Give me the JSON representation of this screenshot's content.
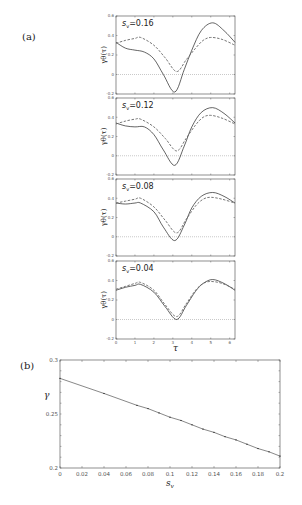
{
  "labels": {
    "a": "(a)",
    "b": "(b)"
  },
  "chart_data": [
    {
      "type": "line",
      "title": "(a)",
      "xlabel": "τ",
      "ylabel": "γθ(τ)",
      "xlim": [
        0,
        6.28
      ],
      "ylim": [
        -0.2,
        0.6
      ],
      "xticks": [
        0,
        1,
        2,
        3,
        4,
        5,
        6
      ],
      "yticks": [
        -0.2,
        0,
        0.2,
        0.4,
        0.6
      ],
      "reference_line": {
        "y": 0,
        "style": "dotted"
      },
      "panels": [
        {
          "annotation": "sv=0.16",
          "series": [
            {
              "name": "solid",
              "style": "solid",
              "x": [
                0,
                0.5,
                1.0,
                1.5,
                2.0,
                2.5,
                3.1,
                3.6,
                4.0,
                4.5,
                5.1,
                5.7,
                6.28
              ],
              "y": [
                0.33,
                0.27,
                0.25,
                0.23,
                0.16,
                0.0,
                -0.18,
                0.05,
                0.25,
                0.45,
                0.53,
                0.45,
                0.33
              ]
            },
            {
              "name": "dashed",
              "style": "dashed",
              "x": [
                0,
                0.5,
                1.0,
                1.3,
                2.0,
                2.6,
                3.2,
                3.7,
                4.2,
                4.6,
                5.0,
                5.6,
                6.28
              ],
              "y": [
                0.32,
                0.35,
                0.37,
                0.38,
                0.3,
                0.17,
                0.03,
                0.15,
                0.27,
                0.35,
                0.38,
                0.36,
                0.3
              ]
            }
          ]
        },
        {
          "annotation": "sv=0.12",
          "series": [
            {
              "name": "solid",
              "style": "solid",
              "x": [
                0,
                0.5,
                1.0,
                1.5,
                2.0,
                2.5,
                3.1,
                3.6,
                4.0,
                4.5,
                5.1,
                5.7,
                6.28
              ],
              "y": [
                0.34,
                0.31,
                0.3,
                0.3,
                0.22,
                0.06,
                -0.1,
                0.1,
                0.3,
                0.45,
                0.5,
                0.44,
                0.34
              ]
            },
            {
              "name": "dashed",
              "style": "dashed",
              "x": [
                0,
                0.5,
                1.0,
                1.3,
                2.0,
                2.6,
                3.2,
                3.7,
                4.2,
                4.6,
                5.0,
                5.6,
                6.28
              ],
              "y": [
                0.33,
                0.36,
                0.38,
                0.38,
                0.3,
                0.18,
                0.05,
                0.18,
                0.32,
                0.4,
                0.42,
                0.39,
                0.33
              ]
            }
          ]
        },
        {
          "annotation": "sv=0.08",
          "series": [
            {
              "name": "solid",
              "style": "solid",
              "x": [
                0,
                0.5,
                1.0,
                1.3,
                2.0,
                2.5,
                3.1,
                3.6,
                4.0,
                4.5,
                5.1,
                5.7,
                6.28
              ],
              "y": [
                0.35,
                0.34,
                0.35,
                0.35,
                0.26,
                0.1,
                -0.04,
                0.12,
                0.3,
                0.42,
                0.46,
                0.42,
                0.35
              ]
            },
            {
              "name": "dashed",
              "style": "dashed",
              "x": [
                0,
                0.5,
                1.0,
                1.3,
                2.0,
                2.6,
                3.2,
                3.7,
                4.2,
                4.6,
                5.0,
                5.6,
                6.28
              ],
              "y": [
                0.35,
                0.37,
                0.39,
                0.4,
                0.31,
                0.17,
                0.04,
                0.18,
                0.32,
                0.39,
                0.41,
                0.39,
                0.35
              ]
            }
          ]
        },
        {
          "annotation": "sv=0.04",
          "series": [
            {
              "name": "solid",
              "style": "solid",
              "x": [
                0,
                0.5,
                1.0,
                1.3,
                2.0,
                2.6,
                3.2,
                3.7,
                4.2,
                4.6,
                5.1,
                5.7,
                6.28
              ],
              "y": [
                0.3,
                0.33,
                0.35,
                0.36,
                0.28,
                0.13,
                0.0,
                0.14,
                0.29,
                0.37,
                0.41,
                0.37,
                0.3
              ]
            },
            {
              "name": "dashed",
              "style": "dashed",
              "x": [
                0,
                0.5,
                1.0,
                1.3,
                2.0,
                2.6,
                3.2,
                3.7,
                4.2,
                4.6,
                5.0,
                5.6,
                6.28
              ],
              "y": [
                0.31,
                0.34,
                0.37,
                0.38,
                0.3,
                0.15,
                0.03,
                0.16,
                0.3,
                0.37,
                0.39,
                0.37,
                0.31
              ]
            }
          ]
        }
      ]
    },
    {
      "type": "line",
      "title": "(b)",
      "xlabel": "sv",
      "ylabel": "γ",
      "xlim": [
        0,
        0.2
      ],
      "ylim": [
        0.2,
        0.3
      ],
      "xticks": [
        0,
        0.02,
        0.04,
        0.06,
        0.08,
        0.1,
        0.12,
        0.14,
        0.16,
        0.18,
        0.2
      ],
      "yticks": [
        0.2,
        0.25,
        0.3
      ],
      "series": [
        {
          "name": "γ vs sv",
          "style": "solid with markers",
          "x": [
            0,
            0.04,
            0.07,
            0.08,
            0.09,
            0.1,
            0.11,
            0.12,
            0.13,
            0.14,
            0.15,
            0.16,
            0.17,
            0.18,
            0.19,
            0.2
          ],
          "y": [
            0.283,
            0.269,
            0.258,
            0.255,
            0.251,
            0.247,
            0.244,
            0.24,
            0.236,
            0.233,
            0.229,
            0.226,
            0.222,
            0.218,
            0.215,
            0.211
          ]
        }
      ]
    }
  ]
}
